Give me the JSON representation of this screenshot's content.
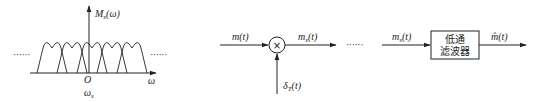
{
  "spectrum": {
    "y_label_main": "M",
    "y_label_sub": "s",
    "y_label_arg": "(ω)",
    "origin_label": "O",
    "x_label": "ω",
    "sample_freq_main": "ω",
    "sample_freq_sub": "s",
    "ellipsis_left": "······",
    "ellipsis_right": "······",
    "lobe_count": 5
  },
  "sampler": {
    "input_label_main": "m(t)",
    "multiplier_symbol": "×",
    "output_label_main": "m",
    "output_label_sub": "s",
    "output_label_arg": "(t)",
    "impulse_label_main": "δ",
    "impulse_label_sub": "T",
    "impulse_label_arg": "(t)",
    "ellipsis": "······"
  },
  "recovery": {
    "input_label_main": "m",
    "input_label_sub": "s",
    "input_label_arg": "(t)",
    "filter_line1": "低通",
    "filter_line2": "滤波器",
    "output_label": "m̂(t)"
  },
  "colors": {
    "stroke": "#222222",
    "background": "#ffffff"
  }
}
